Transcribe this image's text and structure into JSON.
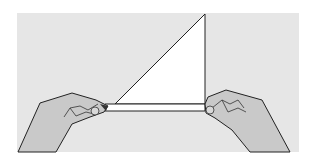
{
  "figure": {
    "colors": {
      "background": "#ffffff",
      "panel": "#e6e6e6",
      "paper": "#ffffff",
      "hand": "#c9c9c9",
      "outline": "#222222"
    }
  }
}
